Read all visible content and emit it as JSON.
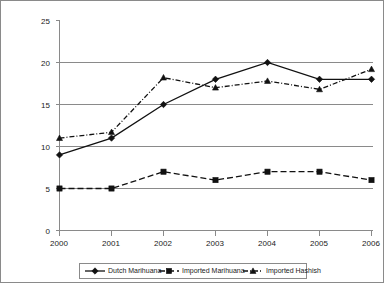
{
  "chart_data": {
    "type": "line",
    "title": "",
    "subtitle": "",
    "xlabel": "",
    "ylabel": "",
    "categories": [
      "2000",
      "2001",
      "2002",
      "2003",
      "2004",
      "2005",
      "2006"
    ],
    "x": [
      2000,
      2001,
      2002,
      2003,
      2004,
      2005,
      2006
    ],
    "ylim": [
      0,
      25
    ],
    "yticks": [
      "0",
      "5",
      "10",
      "15",
      "20",
      "25"
    ],
    "ytick_values": [
      0,
      5,
      10,
      15,
      20,
      25
    ],
    "grid": "horizontal",
    "legend_position": "bottom",
    "series": [
      {
        "name": "Dutch Marihuana",
        "values": [
          9,
          11,
          15,
          18,
          20,
          18,
          18
        ],
        "line_style": "solid",
        "marker": "diamond",
        "color": "#111111"
      },
      {
        "name": "Imported Marihuana",
        "values": [
          5,
          5,
          7,
          6,
          7,
          7,
          6
        ],
        "line_style": "dashed",
        "marker": "square",
        "color": "#111111"
      },
      {
        "name": "Imported Hashish",
        "values": [
          11,
          11.7,
          18.2,
          17,
          17.8,
          16.8,
          19.2
        ],
        "line_style": "dashdot",
        "marker": "triangle",
        "color": "#111111"
      }
    ],
    "annotations": []
  },
  "axes": {
    "ytick_labels": [
      "25",
      "20",
      "15",
      "10",
      "5",
      "0"
    ],
    "xtick_labels": [
      "2000",
      "2001",
      "2002",
      "2003",
      "2004",
      "2005",
      "2006"
    ]
  },
  "legend": {
    "entries": [
      {
        "label": "Dutch Marihuana"
      },
      {
        "label": "Imported Marihuana"
      },
      {
        "label": "Imported Hashish"
      }
    ]
  },
  "colors": {
    "axis": "#8a8a8a",
    "grid": "#8a8a8a",
    "ink": "#111111",
    "background": "#ffffff"
  }
}
